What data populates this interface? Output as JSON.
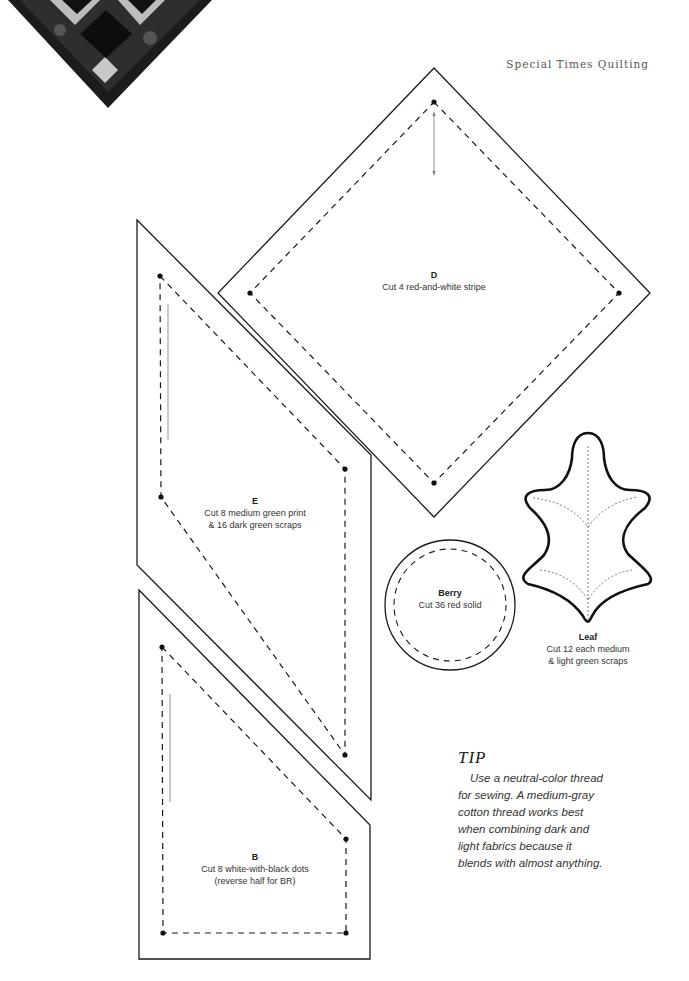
{
  "header": {
    "title": "Special Times Quilting"
  },
  "corner_image": {
    "description": "quilt-corner-thumbnail"
  },
  "templates": [
    {
      "id": "D",
      "name": "D",
      "instructions": "Cut 4 red-and-white stripe"
    },
    {
      "id": "E",
      "name": "E",
      "instructions_line1": "Cut 8 medium green print",
      "instructions_line2": "& 16 dark green scraps"
    },
    {
      "id": "B",
      "name": "B",
      "instructions_line1": "Cut 8 white-with-black dots",
      "instructions_line2": "(reverse half for BR)"
    },
    {
      "id": "Berry",
      "name": "Berry",
      "instructions": "Cut 36 red solid"
    },
    {
      "id": "Leaf",
      "name": "Leaf",
      "instructions_line1": "Cut 12 each medium",
      "instructions_line2": "& light green scraps"
    }
  ],
  "tip": {
    "title": "TIP",
    "body": "Use a neutral-color thread for sewing. A medium-gray cotton thread works best when combining dark and light fabrics because it blends with almost anything."
  },
  "colors": {
    "line": "#1a1a1a",
    "text": "#333333",
    "background": "#ffffff"
  }
}
